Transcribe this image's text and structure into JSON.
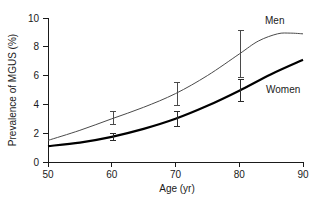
{
  "chart_data": {
    "type": "line",
    "title": "",
    "xlabel": "Age (yr)",
    "ylabel": "Prevalence of MGUS (%)",
    "xlim": [
      50,
      90
    ],
    "ylim": [
      0,
      10
    ],
    "xticks": [
      50,
      60,
      70,
      80,
      90
    ],
    "yticks": [
      0,
      2,
      4,
      6,
      8,
      10
    ],
    "grid": false,
    "legend_position": "inline-right",
    "series": [
      {
        "name": "Men",
        "label": "Men",
        "color": "#4a4a4a",
        "x": [
          50,
          55,
          60,
          65,
          70,
          75,
          80,
          83,
          86,
          88,
          90
        ],
        "values": [
          1.5,
          2.2,
          3.0,
          3.8,
          4.75,
          6.0,
          7.5,
          8.4,
          8.9,
          8.95,
          8.9
        ],
        "error_bars": [
          {
            "x": 60,
            "y": 3.0,
            "low": 2.6,
            "high": 3.5
          },
          {
            "x": 70,
            "y": 4.75,
            "low": 3.95,
            "high": 5.5
          },
          {
            "x": 80,
            "y": 7.5,
            "low": 5.9,
            "high": 9.1
          }
        ]
      },
      {
        "name": "Women",
        "label": "Women",
        "color": "#000000",
        "x": [
          50,
          55,
          60,
          65,
          70,
          75,
          80,
          85,
          90
        ],
        "values": [
          1.1,
          1.35,
          1.75,
          2.3,
          3.0,
          3.9,
          4.95,
          6.1,
          7.1
        ],
        "error_bars": [
          {
            "x": 60,
            "y": 1.75,
            "low": 1.5,
            "high": 2.0
          },
          {
            "x": 70,
            "y": 3.0,
            "low": 2.5,
            "high": 3.5
          },
          {
            "x": 80,
            "y": 4.95,
            "low": 4.2,
            "high": 5.7
          }
        ]
      }
    ]
  },
  "axes": {
    "x_tick_labels": [
      "50",
      "60",
      "70",
      "80",
      "90"
    ],
    "y_tick_labels": [
      "0",
      "2",
      "4",
      "6",
      "8",
      "10"
    ],
    "x_title": "Age (yr)",
    "y_title": "Prevalence of MGUS (%)"
  },
  "labels": {
    "men": "Men",
    "women": "Women"
  }
}
